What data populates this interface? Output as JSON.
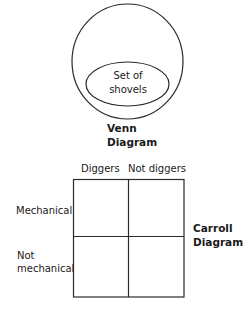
{
  "venn": {
    "subset_label_line1": "Set of",
    "subset_label_line2": "shovels",
    "title_line1": "Venn",
    "title_line2": "Diagram"
  },
  "carroll": {
    "column_headers": [
      "Diggers",
      "Not diggers"
    ],
    "row_headers": [
      {
        "line1": "Mechanical"
      },
      {
        "line1": "Not",
        "line2": "mechanical"
      }
    ],
    "title_line1": "Carroll",
    "title_line2": "Diagram"
  },
  "colors": {
    "stroke": "#2a2a2a",
    "background": "#ffffff"
  }
}
